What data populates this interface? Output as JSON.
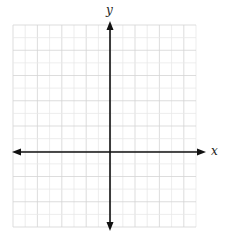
{
  "diagram": {
    "type": "coordinate-plane",
    "title": "",
    "axes": {
      "x_label": "x",
      "y_label": "y",
      "arrows": "both-ends"
    },
    "grid": {
      "columns": 15,
      "rows": 16,
      "left": 13,
      "top": 25,
      "right": 196,
      "bottom": 227,
      "origin_px": [
        110,
        152
      ],
      "line_color": "#d4d4d4",
      "minor_line_color": "#e8e8e8"
    },
    "axis_color": "#111111",
    "background": "#ffffff"
  }
}
